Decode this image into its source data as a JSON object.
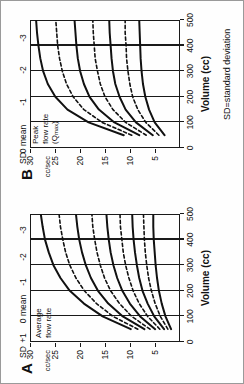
{
  "figure": {
    "caption": "SD=standard deviation",
    "axis": {
      "x_title": "Volume (cc)",
      "x_ticks": [
        "0",
        "100",
        "200",
        "300",
        "400",
        "500"
      ],
      "y_ticks": [
        "30",
        "25",
        "20",
        "15",
        "10",
        "5"
      ],
      "y_unit": "cc/sec",
      "sd_header": "SD"
    },
    "panels": [
      {
        "letter": "A",
        "inplot_label_line1": "Average",
        "inplot_label_line2": "flow rate",
        "inplot_label_line3": "",
        "sd_labels": [
          "+1",
          "0 mean",
          "-1",
          "-2",
          "-3"
        ]
      },
      {
        "letter": "B",
        "inplot_label_line1": "Peak",
        "inplot_label_line2": "flow rate",
        "inplot_label_line3": "(Qmax)",
        "sd_labels": [
          "0 mean",
          "-1",
          "-2",
          "-3"
        ]
      }
    ]
  },
  "chart_data": {
    "type": "line",
    "title": "",
    "xlabel": "Volume (cc)",
    "ylabel": "cc/sec",
    "xlim": [
      0,
      500
    ],
    "ylim": [
      0,
      32
    ],
    "grid": "vertical gridlines at 100, 200, 300, 400",
    "legend": "SD curve labels at right edge of each panel",
    "annotation": "SD=standard deviation",
    "panels": [
      {
        "name": "A",
        "description": "Average flow rate nomogram",
        "x": [
          50,
          100,
          150,
          200,
          250,
          300,
          350,
          400,
          450,
          500
        ],
        "series": [
          {
            "name": "+1 SD",
            "style": "solid",
            "values": [
              10.5,
              16.5,
              20.5,
              23.5,
              25.5,
              27.0,
              28.0,
              28.8,
              29.3,
              29.7
            ]
          },
          {
            "name": "+0.5 SD",
            "style": "dashed",
            "values": [
              9.0,
              14.3,
              17.8,
              20.4,
              22.2,
              23.5,
              24.4,
              25.0,
              25.5,
              25.8
            ]
          },
          {
            "name": "0 mean",
            "style": "solid",
            "values": [
              7.6,
              12.2,
              15.3,
              17.5,
              19.0,
              20.1,
              20.9,
              21.5,
              21.9,
              22.2
            ]
          },
          {
            "name": "-0.5 SD",
            "style": "dashed",
            "values": [
              6.4,
              10.3,
              12.9,
              14.8,
              16.1,
              17.0,
              17.7,
              18.2,
              18.6,
              18.8
            ]
          },
          {
            "name": "-1 SD",
            "style": "solid",
            "values": [
              5.3,
              8.5,
              10.7,
              12.3,
              13.4,
              14.2,
              14.8,
              15.2,
              15.5,
              15.7
            ]
          },
          {
            "name": "-1.5 SD",
            "style": "dashed",
            "values": [
              4.3,
              6.9,
              8.7,
              10.0,
              10.9,
              11.6,
              12.1,
              12.4,
              12.7,
              12.8
            ]
          },
          {
            "name": "-2 SD",
            "style": "solid",
            "values": [
              3.4,
              5.5,
              6.9,
              8.0,
              8.7,
              9.2,
              9.6,
              9.9,
              10.1,
              10.2
            ]
          },
          {
            "name": "-2.5 SD",
            "style": "dashed",
            "values": [
              2.6,
              4.2,
              5.3,
              6.1,
              6.7,
              7.1,
              7.4,
              7.6,
              7.7,
              7.8
            ]
          },
          {
            "name": "-3 SD",
            "style": "solid",
            "values": [
              1.9,
              3.1,
              3.9,
              4.5,
              4.9,
              5.2,
              5.4,
              5.6,
              5.7,
              5.7
            ]
          }
        ]
      },
      {
        "name": "B",
        "description": "Peak flow rate (Qmax) nomogram",
        "x": [
          50,
          100,
          150,
          200,
          250,
          300,
          350,
          400,
          450,
          500
        ],
        "series": [
          {
            "name": "0 mean",
            "style": "solid",
            "values": [
              12.0,
              19.5,
              24.0,
              26.6,
              28.2,
              29.2,
              29.8,
              30.2,
              30.5,
              30.7
            ]
          },
          {
            "name": "-0.5 SD",
            "style": "dashed",
            "values": [
              10.3,
              16.6,
              20.5,
              22.8,
              24.2,
              25.1,
              25.7,
              26.1,
              26.3,
              26.5
            ]
          },
          {
            "name": "-1 SD",
            "style": "solid",
            "values": [
              8.7,
              14.0,
              17.3,
              19.3,
              20.5,
              21.3,
              21.8,
              22.1,
              22.3,
              22.5
            ]
          },
          {
            "name": "-1.5 SD",
            "style": "dashed",
            "values": [
              7.2,
              11.6,
              14.3,
              16.0,
              17.0,
              17.6,
              18.1,
              18.3,
              18.5,
              18.6
            ]
          },
          {
            "name": "-2 SD",
            "style": "solid",
            "values": [
              5.8,
              9.4,
              11.6,
              12.9,
              13.8,
              14.3,
              14.6,
              14.8,
              15.0,
              15.1
            ]
          },
          {
            "name": "-2.5 SD",
            "style": "dashed",
            "values": [
              4.5,
              7.3,
              9.0,
              10.1,
              10.7,
              11.1,
              11.4,
              11.5,
              11.7,
              11.7
            ]
          },
          {
            "name": "-3 SD",
            "style": "solid",
            "values": [
              3.3,
              5.4,
              6.6,
              7.4,
              7.9,
              8.2,
              8.4,
              8.5,
              8.6,
              8.7
            ]
          }
        ]
      }
    ]
  }
}
